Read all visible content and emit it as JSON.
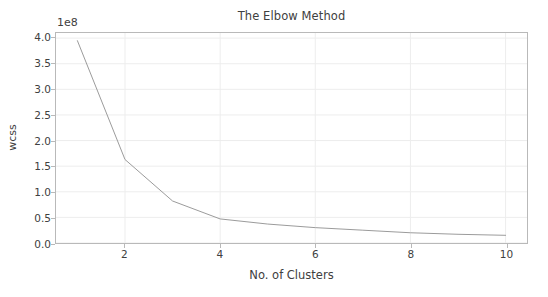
{
  "chart_data": {
    "type": "line",
    "title": "The Elbow Method",
    "xlabel": "No. of Clusters",
    "ylabel": "wcss",
    "y_offset_label": "1e8",
    "y_offset_multiplier": 100000000,
    "x": [
      1,
      2,
      3,
      4,
      5,
      6,
      7,
      8,
      9,
      10
    ],
    "values": [
      3.95,
      1.63,
      0.82,
      0.47,
      0.37,
      0.3,
      0.25,
      0.2,
      0.17,
      0.15
    ],
    "xlim": [
      0.55,
      10.45
    ],
    "ylim": [
      0.0,
      4.1
    ],
    "xticks": [
      "2",
      "4",
      "6",
      "8",
      "10"
    ],
    "xtick_values": [
      2,
      4,
      6,
      8,
      10
    ],
    "yticks": [
      "0.0",
      "0.5",
      "1.0",
      "1.5",
      "2.0",
      "2.5",
      "3.0",
      "3.5",
      "4.0"
    ],
    "ytick_values": [
      0.0,
      0.5,
      1.0,
      1.5,
      2.0,
      2.5,
      3.0,
      3.5,
      4.0
    ],
    "grid": true,
    "legend": null,
    "line_color": "#9a9a9a",
    "grid_color": "#ededed",
    "frame_color": "#b9b9b9",
    "background_color": "#ffffff"
  }
}
